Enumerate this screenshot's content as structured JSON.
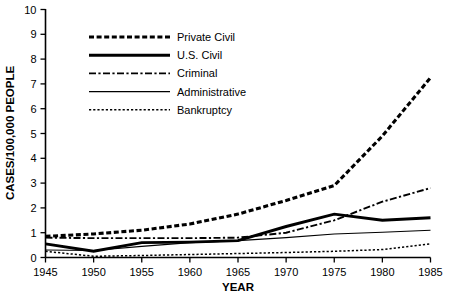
{
  "chart_data": {
    "type": "line",
    "title": "",
    "xlabel": "YEAR",
    "ylabel": "CASES/100,000 PEOPLE",
    "xlim": [
      1945,
      1985
    ],
    "ylim": [
      0,
      10
    ],
    "grid": false,
    "legend_position": "upper-left-inside",
    "x_ticks": [
      1945,
      1950,
      1955,
      1960,
      1965,
      1970,
      1975,
      1980,
      1985
    ],
    "y_ticks": [
      0,
      1,
      2,
      3,
      4,
      5,
      6,
      7,
      8,
      9,
      10
    ],
    "x": [
      1945,
      1950,
      1955,
      1960,
      1965,
      1970,
      1975,
      1980,
      1985
    ],
    "series": [
      {
        "name": "Private Civil",
        "style": "thick-dashed",
        "values": [
          0.85,
          0.95,
          1.1,
          1.35,
          1.75,
          2.3,
          2.9,
          4.9,
          7.25
        ]
      },
      {
        "name": "U.S. Civil",
        "style": "thick-solid",
        "values": [
          0.55,
          0.25,
          0.6,
          0.62,
          0.68,
          1.25,
          1.75,
          1.5,
          1.6
        ]
      },
      {
        "name": "Criminal",
        "style": "dash-dot",
        "values": [
          0.8,
          0.78,
          0.78,
          0.78,
          0.8,
          1.0,
          1.5,
          2.25,
          2.8
        ]
      },
      {
        "name": "Administrative",
        "style": "thin-solid",
        "values": [
          0.3,
          0.28,
          0.45,
          0.6,
          0.68,
          0.8,
          0.95,
          1.02,
          1.1
        ]
      },
      {
        "name": "Bankruptcy",
        "style": "fine-dotted",
        "values": [
          0.25,
          0.05,
          0.08,
          0.12,
          0.16,
          0.2,
          0.25,
          0.32,
          0.55
        ]
      }
    ]
  },
  "axes": {
    "y_title": "CASES/100,000 PEOPLE",
    "x_title": "YEAR",
    "y_tick_labels": [
      "0",
      "1",
      "2",
      "3",
      "4",
      "5",
      "6",
      "7",
      "8",
      "9",
      "10"
    ],
    "x_tick_labels": [
      "1945",
      "1950",
      "1955",
      "1960",
      "1965",
      "1970",
      "1975",
      "1980",
      "1985"
    ]
  },
  "legend": {
    "entries": [
      {
        "label": "Private Civil",
        "style": "thick-dashed"
      },
      {
        "label": "U.S. Civil",
        "style": "thick-solid"
      },
      {
        "label": "Criminal",
        "style": "dash-dot"
      },
      {
        "label": "Administrative",
        "style": "thin-solid"
      },
      {
        "label": "Bankruptcy",
        "style": "fine-dotted"
      }
    ]
  },
  "colors": {
    "ink": "#000000",
    "background": "#ffffff"
  }
}
